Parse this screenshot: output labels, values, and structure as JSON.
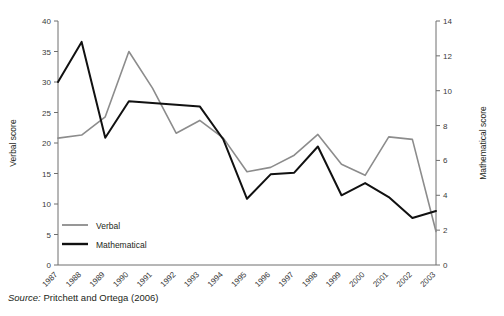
{
  "chart_data": {
    "type": "line",
    "title": "",
    "xlabel": "",
    "ylabel": "Verbal score",
    "y2label": "Mathematical score",
    "grid": false,
    "legend_position": "inside-bottom-left",
    "categories": [
      "1987",
      "1988",
      "1989",
      "1990",
      "1991",
      "1992",
      "1993",
      "1994",
      "1995",
      "1996",
      "1997",
      "1998",
      "1999",
      "2000",
      "2001",
      "2002",
      "2003"
    ],
    "ylim": [
      0,
      40
    ],
    "yticks": [
      0,
      5,
      10,
      15,
      20,
      25,
      30,
      35,
      40
    ],
    "y2lim": [
      0,
      14
    ],
    "y2ticks": [
      0,
      2,
      4,
      6,
      8,
      10,
      12,
      14
    ],
    "series": [
      {
        "name": "Verbal",
        "axis": "left",
        "color": "#8c8c8c",
        "values": [
          20.8,
          21.3,
          24.3,
          35.0,
          29.0,
          21.6,
          23.7,
          20.8,
          15.3,
          16.0,
          18.0,
          21.4,
          16.5,
          14.7,
          21.0,
          20.6,
          5.5
        ]
      },
      {
        "name": "Mathematical",
        "axis": "right",
        "color": "#111111",
        "values": [
          10.5,
          12.8,
          7.3,
          9.4,
          9.3,
          9.2,
          9.1,
          7.2,
          3.8,
          5.2,
          5.3,
          6.8,
          4.0,
          4.7,
          3.9,
          2.7,
          3.1
        ]
      }
    ]
  },
  "axes": {
    "left_title": "Verbal score",
    "right_title": "Mathematical score"
  },
  "legend": {
    "items": [
      {
        "label": "Verbal",
        "color": "#8c8c8c"
      },
      {
        "label": "Mathematical",
        "color": "#111111"
      }
    ]
  },
  "source": {
    "keyword": "Source:",
    "text": " Pritchett and Ortega (2006)"
  }
}
